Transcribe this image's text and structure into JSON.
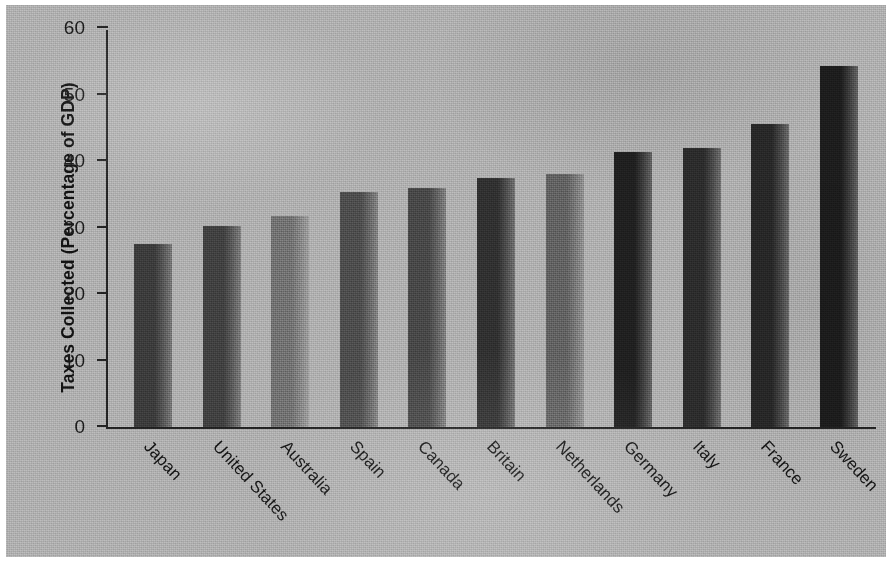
{
  "chart_data": {
    "type": "bar",
    "title": "",
    "xlabel": "",
    "ylabel": "Taxes Collected (Percentage of GDP)",
    "ylim": [
      0,
      60
    ],
    "yticks": [
      0,
      10,
      20,
      30,
      40,
      50,
      60
    ],
    "ytick_labels": [
      "0",
      "10",
      "20",
      "30",
      "40",
      "50",
      "60"
    ],
    "grid": false,
    "legend": false,
    "categories": [
      "Japan",
      "United States",
      "Australia",
      "Spain",
      "Canada",
      "Britain",
      "Netherlands",
      "Germany",
      "Italy",
      "France",
      "Sweden"
    ],
    "values": [
      27.5,
      30.2,
      31.7,
      35.4,
      36.0,
      37.4,
      38.0,
      41.4,
      42.0,
      45.5,
      54.3
    ],
    "bar_shades": [
      "#3a3a3a",
      "#3f3f3f",
      "#6f6f6f",
      "#4b4b4b",
      "#464646",
      "#2f2f2f",
      "#5f5f5f",
      "#1f1f1f",
      "#2b2b2b",
      "#272727",
      "#1c1c1c"
    ]
  },
  "figure": {
    "paper_color": "#adadad",
    "ink_color": "#141414"
  }
}
